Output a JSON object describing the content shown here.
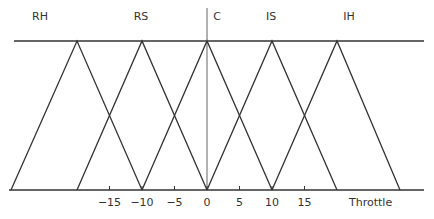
{
  "diagram": {
    "type": "fuzzy-membership-functions",
    "axis_label": "Throttle",
    "sets": [
      {
        "label": "RH",
        "left": -30,
        "peak": -20,
        "right": -10,
        "label_x": 40
      },
      {
        "label": "RS",
        "left": -20,
        "peak": -10,
        "right": 0,
        "label_x": 141
      },
      {
        "label": "C",
        "left": -10,
        "peak": 0,
        "right": 10,
        "label_x": 217
      },
      {
        "label": "IS",
        "left": 0,
        "peak": 10,
        "right": 20,
        "label_x": 271
      },
      {
        "label": "IH",
        "left": 10,
        "peak": 20,
        "right": 30,
        "label_x": 349
      }
    ],
    "ticks": [
      {
        "value": -15,
        "label": "−15"
      },
      {
        "value": -10,
        "label": "−10"
      },
      {
        "value": -5,
        "label": "−5"
      },
      {
        "value": 0,
        "label": "0"
      },
      {
        "value": 5,
        "label": "5"
      },
      {
        "value": 10,
        "label": "10"
      },
      {
        "value": 15,
        "label": "15"
      }
    ],
    "colors": {
      "line": "#333333",
      "vertical_axis": "#888888"
    }
  }
}
